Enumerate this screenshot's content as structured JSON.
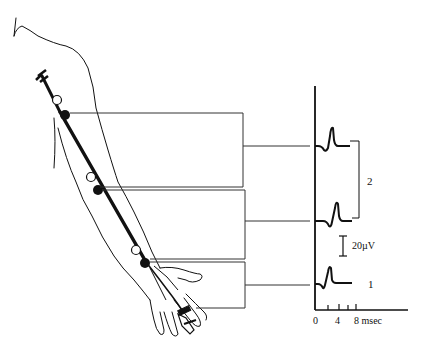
{
  "figure": {
    "type": "nerve-conduction-diagram",
    "stimulation_sites": [
      {
        "name": "proximal (upper arm)",
        "anode": "open-circle",
        "cathode": "filled-circle"
      },
      {
        "name": "elbow",
        "anode": "open-circle",
        "cathode": "filled-circle"
      },
      {
        "name": "wrist",
        "anode": "open-circle",
        "cathode": "filled-circle"
      }
    ],
    "recording_site": "finger ring electrodes"
  },
  "traces": {
    "labels": {
      "bracket_label": "2",
      "bottom_label": "1"
    },
    "scale_bar": "20µV",
    "time_axis": {
      "tick_labels": [
        "0",
        "4",
        "8 msec"
      ]
    }
  }
}
